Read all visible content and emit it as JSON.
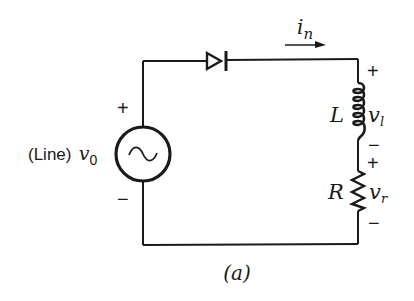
{
  "figure": {
    "caption": "(a)",
    "source": {
      "prefix": "(Line)",
      "symbol": "v",
      "subscript": "0",
      "glyph": "~",
      "plus": "+",
      "minus": "−"
    },
    "diode": {
      "type": "diode",
      "direction": "right"
    },
    "current": {
      "symbol": "i",
      "subscript": "n",
      "arrow": "→"
    },
    "inductor": {
      "label": "L",
      "voltage_symbol": "v",
      "voltage_subscript": "l",
      "plus": "+",
      "minus": "−"
    },
    "resistor": {
      "label": "R",
      "voltage_symbol": "v",
      "voltage_subscript": "r",
      "plus": "+",
      "minus": "−"
    }
  },
  "colors": {
    "ink": "#1a1a1a",
    "background": "#ffffff"
  }
}
